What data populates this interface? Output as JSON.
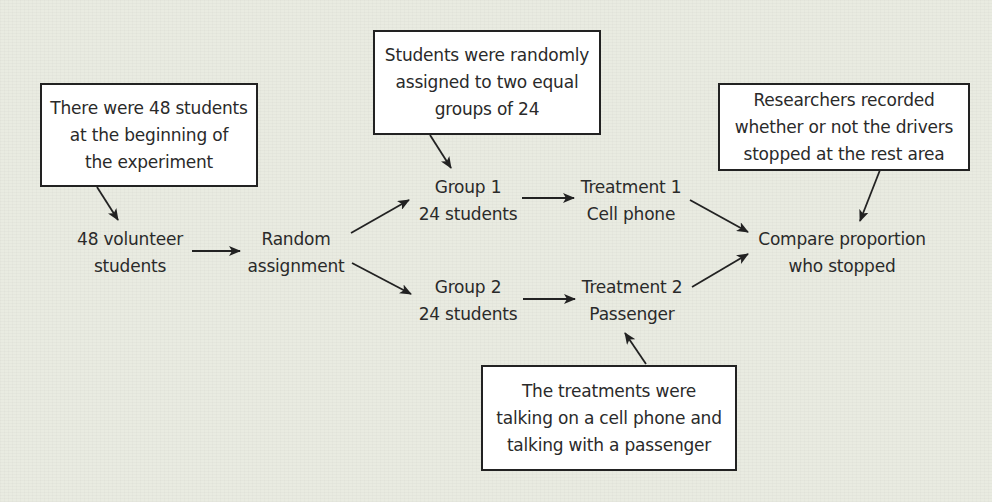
{
  "diagram": {
    "type": "experimental-design-flowchart",
    "nodes": {
      "volunteers": {
        "line1": "48 volunteer",
        "line2": "students"
      },
      "random": {
        "line1": "Random",
        "line2": "assignment"
      },
      "group1": {
        "line1": "Group 1",
        "line2": "24 students"
      },
      "group2": {
        "line1": "Group 2",
        "line2": "24 students"
      },
      "treatment1": {
        "line1": "Treatment 1",
        "line2": "Cell phone"
      },
      "treatment2": {
        "line1": "Treatment 2",
        "line2": "Passenger"
      },
      "compare": {
        "line1": "Compare proportion",
        "line2": "who stopped"
      }
    },
    "callouts": {
      "students_count": {
        "line1": "There were 48 students",
        "line2": "at the beginning of",
        "line3": "the experiment"
      },
      "random_groups": {
        "line1": "Students were randomly",
        "line2": "assigned to two equal",
        "line3": "groups of 24"
      },
      "recorded": {
        "line1": "Researchers recorded",
        "line2": "whether or not the drivers",
        "line3": "stopped at the rest area"
      },
      "treatments": {
        "line1": "The treatments were",
        "line2": "talking on a cell phone and",
        "line3": "talking with a passenger"
      }
    },
    "edges": [
      [
        "volunteers",
        "random"
      ],
      [
        "random",
        "group1"
      ],
      [
        "random",
        "group2"
      ],
      [
        "group1",
        "treatment1"
      ],
      [
        "group2",
        "treatment2"
      ],
      [
        "treatment1",
        "compare"
      ],
      [
        "treatment2",
        "compare"
      ],
      [
        "students_count",
        "volunteers"
      ],
      [
        "random_groups",
        "group1"
      ],
      [
        "recorded",
        "compare"
      ],
      [
        "treatments",
        "treatment2"
      ]
    ],
    "colors": {
      "background": "#e9ebe1",
      "box_fill": "#ffffff",
      "stroke": "#222222",
      "text": "#2a2a2a"
    }
  }
}
